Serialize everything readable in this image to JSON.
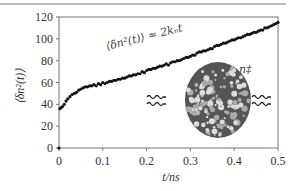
{
  "chart_data": {
    "type": "scatter",
    "title": "",
    "xlabel": "t/ns",
    "ylabel": "⟨δn²(t)⟩",
    "xlim": [
      0,
      0.5
    ],
    "ylim": [
      0,
      120
    ],
    "xticks": [
      0,
      0.1,
      0.2,
      0.3,
      0.4,
      0.5
    ],
    "xtick_labels": [
      "0",
      "0.1",
      "0.2",
      "0.3",
      "0.4",
      "0.5"
    ],
    "yticks": [
      0,
      20,
      40,
      60,
      80,
      100,
      120
    ],
    "ytick_labels": [
      "0",
      "20",
      "40",
      "60",
      "80",
      "100",
      "120"
    ],
    "grid": false,
    "legend": null,
    "annotations": [
      {
        "text": "⟨δn²(t)⟩ ≈ 2kₙt",
        "x": 0.08,
        "y": 82,
        "rotation": -15
      },
      {
        "text": "n‡",
        "x": 0.36,
        "y": 68
      }
    ],
    "series": [
      {
        "name": "⟨δn²(t)⟩",
        "marker": "dot",
        "x": [
          0,
          0.002,
          0.005,
          0.008,
          0.012,
          0.016,
          0.02,
          0.025,
          0.03,
          0.035,
          0.04,
          0.045,
          0.05,
          0.055,
          0.06,
          0.065,
          0.07,
          0.075,
          0.08,
          0.085,
          0.09,
          0.095,
          0.1,
          0.105,
          0.11,
          0.115,
          0.12,
          0.125,
          0.13,
          0.135,
          0.14,
          0.145,
          0.15,
          0.155,
          0.16,
          0.165,
          0.17,
          0.175,
          0.18,
          0.185,
          0.19,
          0.195,
          0.2,
          0.205,
          0.21,
          0.215,
          0.22,
          0.225,
          0.23,
          0.235,
          0.24,
          0.245,
          0.25,
          0.255,
          0.26,
          0.265,
          0.27,
          0.275,
          0.28,
          0.285,
          0.29,
          0.295,
          0.3,
          0.305,
          0.31,
          0.315,
          0.32,
          0.325,
          0.33,
          0.335,
          0.34,
          0.345,
          0.35,
          0.355,
          0.36,
          0.365,
          0.37,
          0.375,
          0.38,
          0.385,
          0.39,
          0.395,
          0.4,
          0.405,
          0.41,
          0.415,
          0.42,
          0.425,
          0.43,
          0.435,
          0.44,
          0.445,
          0.45,
          0.455,
          0.46,
          0.465,
          0.47,
          0.475,
          0.48,
          0.485,
          0.49,
          0.495,
          0.5
        ],
        "y": [
          0,
          36,
          37,
          38,
          40,
          43,
          45,
          47,
          49,
          50,
          51,
          53,
          54,
          55,
          56,
          56,
          57,
          57,
          58,
          57,
          59,
          58,
          60,
          59,
          60,
          61,
          61,
          62,
          62,
          63,
          63,
          64,
          64,
          65,
          66,
          66,
          67,
          67,
          68,
          68,
          70,
          69,
          71,
          72,
          72,
          73,
          73,
          74,
          75,
          75,
          76,
          77,
          76,
          78,
          79,
          79,
          80,
          80,
          81,
          82,
          83,
          83,
          84,
          85,
          85,
          87,
          88,
          88,
          89,
          89,
          90,
          91,
          91,
          93,
          94,
          94,
          95,
          96,
          96,
          97,
          98,
          99,
          99,
          100,
          101,
          101,
          102,
          103,
          104,
          104,
          105,
          106,
          106,
          107,
          108,
          108,
          110,
          110,
          111,
          112,
          113,
          114,
          115
        ]
      }
    ]
  },
  "figure": {
    "cluster_label": "n‡",
    "fit_label": "⟨δn²(t)⟩ ≈ 2kₙt"
  }
}
